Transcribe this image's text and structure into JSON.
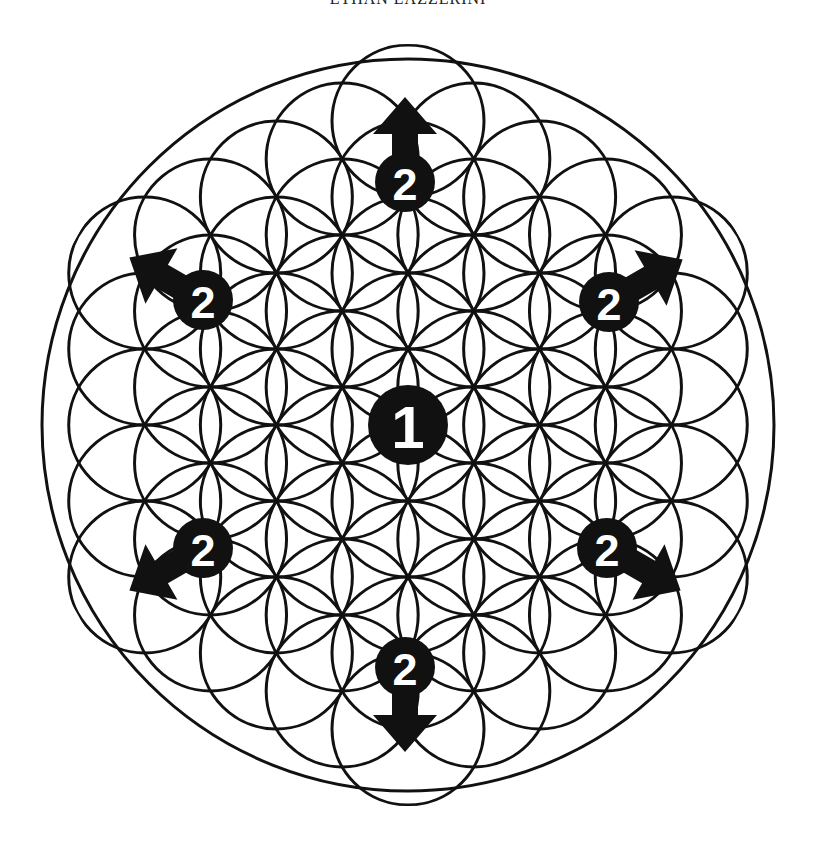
{
  "header": {
    "text": "ETHAN LAZZERINI"
  },
  "diagram": {
    "center": [
      408,
      425
    ],
    "outer_radius": 366,
    "circle_radius": 76,
    "stroke_color": "#111111",
    "badge_color": "#111111",
    "badges": [
      {
        "label": "1",
        "x": 408,
        "y": 425,
        "r": 40,
        "arrow": null
      },
      {
        "label": "2",
        "x": 405,
        "y": 182,
        "r": 30,
        "arrow": 0
      },
      {
        "label": "2",
        "x": 203,
        "y": 300,
        "r": 30,
        "arrow": -60
      },
      {
        "label": "2",
        "x": 609,
        "y": 302,
        "r": 30,
        "arrow": 60
      },
      {
        "label": "2",
        "x": 203,
        "y": 548,
        "r": 30,
        "arrow": -120
      },
      {
        "label": "2",
        "x": 607,
        "y": 548,
        "r": 30,
        "arrow": 120
      },
      {
        "label": "2",
        "x": 405,
        "y": 667,
        "r": 30,
        "arrow": 180
      }
    ]
  }
}
